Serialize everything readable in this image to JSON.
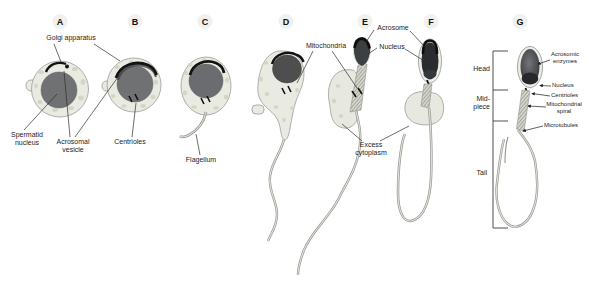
{
  "figure": {
    "stages": {
      "a": "A",
      "b": "B",
      "c": "C",
      "d": "D",
      "e": "E",
      "f": "F",
      "g": "G"
    },
    "labels": {
      "golgi_apparatus": "Golgi apparatus",
      "spermatid_nucleus": "Spermatid\nnucleus",
      "acrosomal_vesicle": "Acrosomal\nvesicle",
      "centrioles": "Centrioles",
      "flagellum": "Flagellum",
      "mitochondria": "Mitochondria",
      "acrosome": "Acrosome",
      "nucleus": "Nucleus",
      "excess_cytoplasm": "Excess\ncytoplasm",
      "region_head": "Head",
      "region_midpiece": "Mid-\npiece",
      "region_tail": "Tail",
      "acrosomic_enzymes": "Acrosomic\nenzymes",
      "g_nucleus": "Nucleus",
      "g_centrioles": "Centrioles",
      "mitochondrial_spiral": "Mitochondrial\nspiral",
      "microtubules": "Microtubules"
    },
    "colors": {
      "cytoplasm": "#e9eae2",
      "speckle": "#d3d5c7",
      "cell_outline": "#9a9d96",
      "nucleus_early": "#6f7173",
      "nucleus_condensing": "#4f4e4f",
      "nucleus_late": "#2a2c2f",
      "acrosome_black": "#121212",
      "tail_stroke": "#93968f",
      "tail_highlight": "#e0e2da",
      "text": "#1c1c1c",
      "background": "#ffffff"
    }
  }
}
